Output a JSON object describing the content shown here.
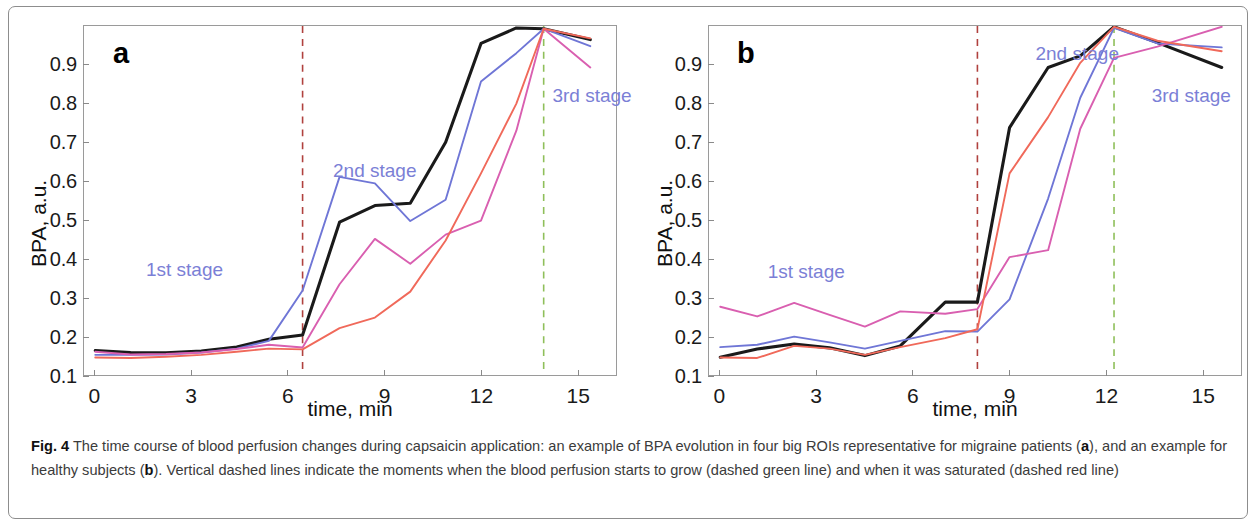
{
  "figure": {
    "label": "Fig. 4",
    "caption_text": " The time course of blood perfusion changes during capsaicin application: an example of BPA evolution in four big ROIs representative for migraine patients (",
    "caption_mid1": "), and an example for healthy subjects (",
    "caption_mid2": "). Vertical dashed lines indicate the moments when the blood perfusion starts to grow (dashed green line) and when it was saturated (dashed red line)",
    "panel_a_ref": "a",
    "panel_b_ref": "b"
  },
  "colors": {
    "series_black": "#1a1a1a",
    "series_blue": "#6f76d6",
    "series_magenta": "#d95fb0",
    "series_salmon": "#f0695a",
    "dashed_red": "#b0413e",
    "dashed_green": "#8fbf5a",
    "stage_label": "#7b7fd6",
    "axis": "#9a9a9a"
  },
  "chart_data": [
    {
      "type": "line",
      "panel": "a",
      "panel_letter": "a",
      "title": "",
      "xlabel": "time, min",
      "ylabel": "BPA, a.u.",
      "xlim": [
        -0.35,
        16.2
      ],
      "ylim": [
        0.1,
        1.0
      ],
      "xticks": [
        0,
        3,
        6,
        9,
        12,
        15
      ],
      "xtick_labels": [
        "0",
        "3",
        "6",
        "9",
        "12",
        "15"
      ],
      "yticks": [
        0.1,
        0.2,
        0.3,
        0.4,
        0.5,
        0.6,
        0.7,
        0.8,
        0.9
      ],
      "ytick_labels": [
        "0.1",
        "0.2",
        "0.3",
        "0.4",
        "0.5",
        "0.6",
        "0.7",
        "0.8",
        "0.9"
      ],
      "grid": false,
      "legend": "none",
      "annotations": [
        {
          "text": "1st stage",
          "x": 1.6,
          "y": 0.4
        },
        {
          "text": "2nd stage",
          "x": 7.4,
          "y": 0.655
        },
        {
          "text": "3rd stage",
          "x": 14.2,
          "y": 0.845
        }
      ],
      "vlines": [
        {
          "x": 6.45,
          "color": "dashed_red",
          "meaning": "blood perfusion starts to grow / saturation marker"
        },
        {
          "x": 13.95,
          "color": "dashed_green",
          "meaning": "blood perfusion saturated marker"
        }
      ],
      "series": [
        {
          "name": "ROI black",
          "color": "#1a1a1a",
          "x": [
            0,
            1.1,
            2.2,
            3.3,
            4.4,
            5.4,
            6.45,
            7.6,
            8.7,
            9.8,
            10.9,
            12.0,
            13.1,
            13.95,
            15.4
          ],
          "values": [
            0.163,
            0.158,
            0.157,
            0.162,
            0.172,
            0.192,
            0.203,
            0.494,
            0.537,
            0.543,
            0.7,
            0.955,
            0.995,
            0.993,
            0.965
          ]
        },
        {
          "name": "ROI blue",
          "color": "#6f76d6",
          "x": [
            0,
            1.1,
            2.2,
            3.3,
            4.4,
            5.4,
            6.45,
            7.6,
            8.7,
            9.8,
            10.9,
            12.0,
            13.1,
            13.95,
            15.4
          ],
          "values": [
            0.152,
            0.152,
            0.153,
            0.158,
            0.168,
            0.188,
            0.318,
            0.611,
            0.594,
            0.497,
            0.552,
            0.857,
            0.93,
            0.993,
            0.948
          ]
        },
        {
          "name": "ROI magenta",
          "color": "#d95fb0",
          "x": [
            0,
            1.1,
            2.2,
            3.3,
            4.4,
            5.4,
            6.45,
            7.6,
            8.7,
            9.8,
            10.9,
            12.0,
            13.1,
            13.95,
            15.4
          ],
          "values": [
            0.16,
            0.153,
            0.154,
            0.158,
            0.167,
            0.178,
            0.171,
            0.334,
            0.451,
            0.387,
            0.462,
            0.498,
            0.73,
            0.993,
            0.893
          ]
        },
        {
          "name": "ROI salmon",
          "color": "#f0695a",
          "x": [
            0,
            1.1,
            2.2,
            3.3,
            4.4,
            5.4,
            6.45,
            7.6,
            8.7,
            9.8,
            10.9,
            12.0,
            13.1,
            13.95,
            15.4
          ],
          "values": [
            0.145,
            0.144,
            0.147,
            0.152,
            0.16,
            0.168,
            0.166,
            0.221,
            0.248,
            0.315,
            0.447,
            0.62,
            0.8,
            0.993,
            0.968
          ]
        }
      ]
    },
    {
      "type": "line",
      "panel": "b",
      "panel_letter": "b",
      "title": "",
      "xlabel": "time, min",
      "ylabel": "BPA, a.u.",
      "xlim": [
        -0.35,
        16.2
      ],
      "ylim": [
        0.1,
        1.0
      ],
      "xticks": [
        0,
        3,
        6,
        9,
        12,
        15
      ],
      "xtick_labels": [
        "0",
        "3",
        "6",
        "9",
        "12",
        "15"
      ],
      "yticks": [
        0.1,
        0.2,
        0.3,
        0.4,
        0.5,
        0.6,
        0.7,
        0.8,
        0.9
      ],
      "ytick_labels": [
        "0.1",
        "0.2",
        "0.3",
        "0.4",
        "0.5",
        "0.6",
        "0.7",
        "0.8",
        "0.9"
      ],
      "grid": false,
      "legend": "none",
      "annotations": [
        {
          "text": "1st stage",
          "x": 1.5,
          "y": 0.395
        },
        {
          "text": "2nd stage",
          "x": 9.8,
          "y": 0.955
        },
        {
          "text": "3rd stage",
          "x": 13.4,
          "y": 0.845
        }
      ],
      "vlines": [
        {
          "x": 8.0,
          "color": "dashed_red",
          "meaning": "blood perfusion starts to grow / saturation marker"
        },
        {
          "x": 12.25,
          "color": "dashed_green",
          "meaning": "blood perfusion saturated marker"
        }
      ],
      "series": [
        {
          "name": "ROI black",
          "color": "#1a1a1a",
          "x": [
            0,
            1.15,
            2.3,
            3.4,
            4.5,
            5.6,
            7.0,
            8.0,
            9.0,
            10.2,
            11.2,
            12.25,
            13.6,
            15.6
          ],
          "values": [
            0.146,
            0.167,
            0.18,
            0.17,
            0.15,
            0.175,
            0.288,
            0.288,
            0.738,
            0.893,
            0.923,
            0.998,
            0.957,
            0.893
          ]
        },
        {
          "name": "ROI blue",
          "color": "#6f76d6",
          "x": [
            0,
            1.15,
            2.3,
            3.4,
            4.5,
            5.6,
            7.0,
            8.0,
            9.0,
            10.2,
            11.2,
            12.25,
            13.6,
            15.6
          ],
          "values": [
            0.172,
            0.178,
            0.199,
            0.184,
            0.168,
            0.188,
            0.213,
            0.212,
            0.295,
            0.555,
            0.815,
            0.995,
            0.955,
            0.945
          ]
        },
        {
          "name": "ROI magenta",
          "color": "#d95fb0",
          "x": [
            0,
            1.15,
            2.3,
            3.4,
            4.5,
            5.6,
            7.0,
            8.0,
            9.0,
            10.2,
            11.2,
            12.25,
            13.6,
            15.6
          ],
          "values": [
            0.276,
            0.251,
            0.286,
            0.255,
            0.225,
            0.264,
            0.258,
            0.27,
            0.404,
            0.422,
            0.735,
            0.918,
            0.947,
            0.998
          ]
        },
        {
          "name": "ROI salmon",
          "color": "#f0695a",
          "x": [
            0,
            1.15,
            2.3,
            3.4,
            4.5,
            5.6,
            7.0,
            8.0,
            9.0,
            10.2,
            11.2,
            12.25,
            13.6,
            15.6
          ],
          "values": [
            0.145,
            0.144,
            0.175,
            0.168,
            0.152,
            0.172,
            0.195,
            0.218,
            0.62,
            0.765,
            0.905,
            0.998,
            0.962,
            0.935
          ]
        }
      ]
    }
  ]
}
